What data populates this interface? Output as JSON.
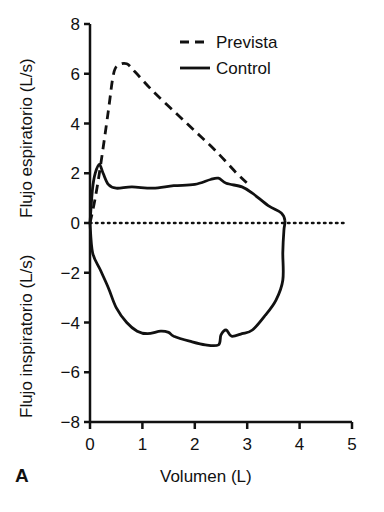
{
  "chart_data": {
    "type": "line",
    "title": "",
    "panel_label": "A",
    "xlabel": "Volumen (L)",
    "ylabel_top": "Flujo espiratorio (L/s)",
    "ylabel_bottom": "Flujo inspiratorio (L/s)",
    "xlim": [
      0,
      5
    ],
    "ylim": [
      -8,
      8
    ],
    "xticks": [
      0,
      1,
      2,
      3,
      4,
      5
    ],
    "yticks": [
      8,
      6,
      4,
      2,
      0,
      -2,
      -4,
      -6,
      -8
    ],
    "ytick_labels": [
      "8",
      "6",
      "4",
      "2",
      "0",
      "−2",
      "−4",
      "−6",
      "−8"
    ],
    "grid": false,
    "legend_position": "upper center",
    "reference_line": {
      "y": 0,
      "style": "dotted",
      "x_range": [
        0,
        4.9
      ]
    },
    "series": [
      {
        "name": "Prevista",
        "style": "dashed",
        "points": [
          [
            0.0,
            0.0
          ],
          [
            0.1,
            1.0
          ],
          [
            0.2,
            2.3
          ],
          [
            0.35,
            4.5
          ],
          [
            0.45,
            6.0
          ],
          [
            0.55,
            6.35
          ],
          [
            0.7,
            6.4
          ],
          [
            0.85,
            6.1
          ],
          [
            1.2,
            5.3
          ],
          [
            1.6,
            4.5
          ],
          [
            2.0,
            3.7
          ],
          [
            2.4,
            2.9
          ],
          [
            2.8,
            2.0
          ],
          [
            3.05,
            1.5
          ]
        ]
      },
      {
        "name": "Control",
        "style": "solid",
        "points": [
          [
            0.0,
            0.0
          ],
          [
            0.05,
            1.4
          ],
          [
            0.1,
            2.0
          ],
          [
            0.18,
            2.35
          ],
          [
            0.25,
            2.0
          ],
          [
            0.35,
            1.55
          ],
          [
            0.5,
            1.4
          ],
          [
            0.8,
            1.45
          ],
          [
            1.2,
            1.4
          ],
          [
            1.6,
            1.5
          ],
          [
            2.0,
            1.55
          ],
          [
            2.3,
            1.75
          ],
          [
            2.45,
            1.8
          ],
          [
            2.6,
            1.6
          ],
          [
            2.9,
            1.45
          ],
          [
            3.1,
            1.2
          ],
          [
            3.4,
            0.7
          ],
          [
            3.65,
            0.4
          ],
          [
            3.72,
            0.1
          ],
          [
            3.7,
            -0.3
          ],
          [
            3.68,
            -1.2
          ],
          [
            3.68,
            -2.3
          ],
          [
            3.55,
            -3.1
          ],
          [
            3.35,
            -3.7
          ],
          [
            3.1,
            -4.3
          ],
          [
            2.9,
            -4.45
          ],
          [
            2.7,
            -4.55
          ],
          [
            2.6,
            -4.3
          ],
          [
            2.5,
            -4.5
          ],
          [
            2.45,
            -4.9
          ],
          [
            2.2,
            -4.9
          ],
          [
            1.9,
            -4.75
          ],
          [
            1.6,
            -4.55
          ],
          [
            1.5,
            -4.4
          ],
          [
            1.35,
            -4.35
          ],
          [
            1.1,
            -4.45
          ],
          [
            0.9,
            -4.35
          ],
          [
            0.7,
            -4.0
          ],
          [
            0.5,
            -3.4
          ],
          [
            0.35,
            -2.6
          ],
          [
            0.2,
            -1.9
          ],
          [
            0.05,
            -1.2
          ],
          [
            0.0,
            0.0
          ]
        ]
      }
    ]
  },
  "legend": {
    "items": [
      {
        "label": "Prevista",
        "style": "dashed"
      },
      {
        "label": "Control",
        "style": "solid"
      }
    ]
  },
  "colors": {
    "line": "#111111",
    "background": "#ffffff"
  }
}
